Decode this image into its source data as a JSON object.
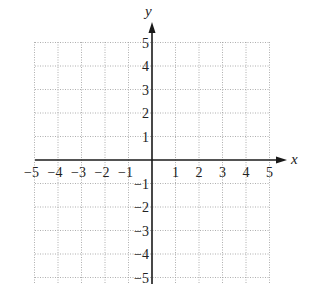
{
  "chart_data": {
    "type": "scatter",
    "title": "",
    "xlabel": "x",
    "ylabel": "y",
    "xlim": [
      -5,
      5
    ],
    "ylim": [
      -5,
      5
    ],
    "grid": true,
    "grid_style": "dotted",
    "x_ticks": [
      -5,
      -4,
      -3,
      -2,
      -1,
      1,
      2,
      3,
      4,
      5
    ],
    "y_ticks": [
      -5,
      -4,
      -3,
      -2,
      -1,
      1,
      2,
      3,
      4,
      5
    ],
    "x_tick_labels": [
      "−5",
      "−4",
      "−3",
      "−2",
      "−1",
      "1",
      "2",
      "3",
      "4",
      "5"
    ],
    "y_tick_labels": [
      "−5",
      "−4",
      "−3",
      "−2",
      "−1",
      "1",
      "2",
      "3",
      "4",
      "5"
    ],
    "series": [],
    "legend": null,
    "axes_arrows": {
      "x_positive": true,
      "y_positive": true
    }
  },
  "layout": {
    "origin_px": [
      152,
      160
    ],
    "unit_px": 23.5,
    "grid_px": {
      "left": 35,
      "right": 270,
      "top": 42,
      "bottom": 283
    },
    "x_axis_px": {
      "start": 35,
      "end": 287
    },
    "y_axis_px": {
      "start": 284,
      "end": 22
    }
  },
  "colors": {
    "axis": "#1a1a1a",
    "grid": "#9a9a9a",
    "text": "#222222",
    "background": "#ffffff"
  }
}
